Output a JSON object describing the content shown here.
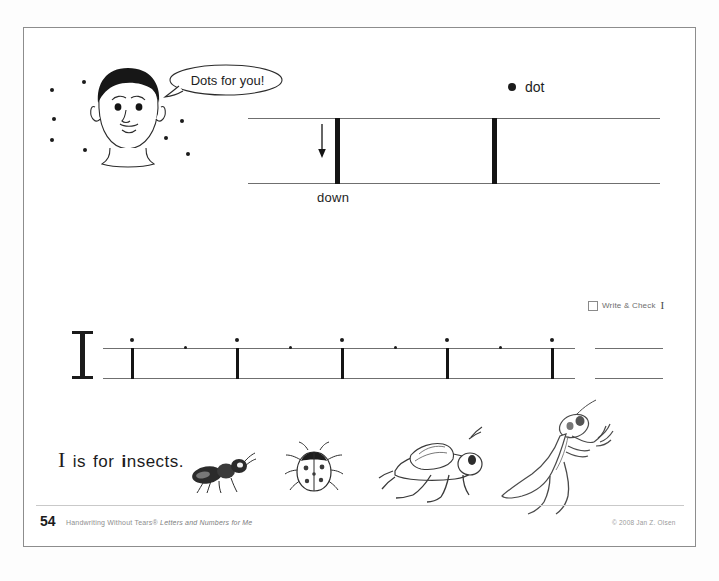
{
  "page": {
    "number": "54",
    "series_line": "Handwriting Without Tears®",
    "book_title": "Letters and Numbers for Me",
    "copyright": "© 2008 Jan Z. Olsen"
  },
  "speech_bubble": {
    "text": "Dots for you!"
  },
  "demo": {
    "legend_label": "dot",
    "legend_icon": "dot-icon",
    "stroke_label": "down",
    "arrow_icon": "down-arrow-icon",
    "stroke_count": 2
  },
  "write_and_check": {
    "label": "Write & Check",
    "letter": "I",
    "checkbox_checked": false
  },
  "practice": {
    "model_letter": "I",
    "stroke_count": 6,
    "start_dots_big": 6,
    "midline_dots": 5
  },
  "sentence": {
    "capital": "I",
    "words": [
      "is",
      "for"
    ],
    "keyword_bold": "i",
    "keyword_rest": "nsects."
  },
  "illustrations": [
    {
      "name": "ant-illustration",
      "label": "ant"
    },
    {
      "name": "ladybug-illustration",
      "label": "ladybug"
    },
    {
      "name": "grasshopper-illustration",
      "label": "grasshopper"
    },
    {
      "name": "praying-mantis-illustration",
      "label": "praying mantis"
    }
  ],
  "colors": {
    "ink": "#1b1b1b",
    "rule": "#6f6f6f",
    "page_border": "#8d8d8d",
    "footer_gray": "#8e8e8e"
  }
}
